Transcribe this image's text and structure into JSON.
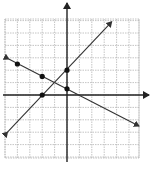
{
  "chart_data": {
    "type": "line",
    "title": "",
    "xlabel": "",
    "ylabel": "",
    "grid": true,
    "xlim": [
      -5,
      6
    ],
    "ylim": [
      -5,
      6
    ],
    "series": [
      {
        "name": "line-1",
        "slope": -0.5,
        "intercept": 0.5,
        "points": [
          [
            -4,
            2.5
          ],
          [
            -2,
            1.5
          ],
          [
            0,
            0.5
          ]
        ],
        "extent": [
          [
            -4.7,
            2.9
          ],
          [
            5.8,
            -2.5
          ]
        ]
      },
      {
        "name": "line-2",
        "slope": 1,
        "intercept": 2,
        "points": [
          [
            -2,
            0
          ],
          [
            0,
            2
          ]
        ],
        "extent": [
          [
            -4.8,
            -3.0
          ],
          [
            3.6,
            5.9
          ]
        ]
      }
    ]
  },
  "layout": {
    "origin_px": [
      67,
      95
    ],
    "unit_px": 12.4,
    "grid_left": 5,
    "grid_right": 139,
    "grid_top": 19,
    "grid_bottom": 158,
    "axis_x_end": 149,
    "axis_y_top": 3,
    "axis_y_bottom": 162,
    "colors": {
      "grid": "#b5b5b5",
      "axis": "#222222",
      "line": "#333333",
      "point": "#111111"
    }
  }
}
